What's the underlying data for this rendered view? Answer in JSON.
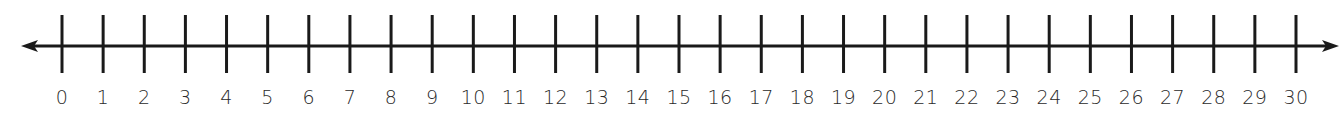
{
  "number_line": {
    "min": 0,
    "max": 30,
    "step": 1,
    "arrows": [
      "left",
      "right"
    ],
    "line_color": "#1a1a1a",
    "labels": [
      "0",
      "1",
      "2",
      "3",
      "4",
      "5",
      "6",
      "7",
      "8",
      "9",
      "10",
      "11",
      "12",
      "13",
      "14",
      "15",
      "16",
      "17",
      "18",
      "19",
      "20",
      "21",
      "22",
      "23",
      "24",
      "25",
      "26",
      "27",
      "28",
      "29",
      "30"
    ]
  }
}
